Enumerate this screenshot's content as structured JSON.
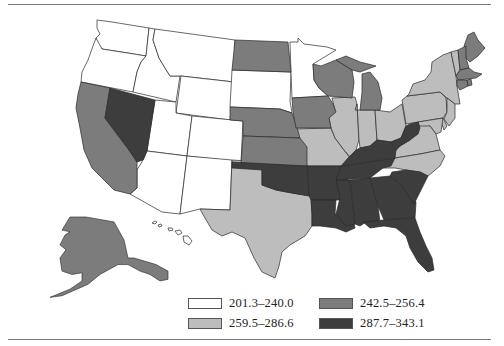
{
  "map": {
    "type": "choropleth",
    "region": "United States",
    "colors": {
      "bin1": "#ffffff",
      "bin2": "#bdbdbd",
      "bin3": "#7c7c7c",
      "bin4": "#3d3d3d",
      "stroke": "#2a2a2a",
      "rule": "#7a7a7a"
    }
  },
  "legend": {
    "items": [
      {
        "label": "201.3–240.0",
        "color": "#ffffff"
      },
      {
        "label": "242.5–256.4",
        "color": "#7c7c7c"
      },
      {
        "label": "259.5–286.6",
        "color": "#bdbdbd"
      },
      {
        "label": "287.7–343.1",
        "color": "#3d3d3d"
      }
    ]
  },
  "states": {
    "bin1_201_3_240_0": [
      "WA",
      "OR",
      "ID",
      "MT",
      "WY",
      "UT",
      "CO",
      "AZ",
      "NM",
      "SD",
      "MN",
      "HI"
    ],
    "bin2_259_5_286_6": [
      "TX",
      "MO",
      "IL",
      "IN",
      "OH",
      "PA",
      "NY",
      "VT",
      "NJ",
      "DE",
      "MD",
      "VA",
      "NC"
    ],
    "bin3_242_5_256_4": [
      "CA",
      "AK",
      "ND",
      "NE",
      "KS",
      "IA",
      "WI",
      "MI",
      "ME",
      "NH",
      "MA",
      "CT",
      "RI"
    ],
    "bin4_287_7_343_1": [
      "NV",
      "OK",
      "AR",
      "LA",
      "MS",
      "AL",
      "GA",
      "FL",
      "SC",
      "TN",
      "KY",
      "WV"
    ]
  }
}
